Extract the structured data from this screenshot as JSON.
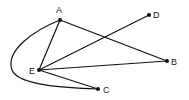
{
  "diagram": {
    "type": "graph",
    "colors": {
      "edge": "#111111",
      "node": "#111111",
      "label": "#222222",
      "background": "#ffffff"
    },
    "nodes": [
      {
        "id": "A",
        "label": "A",
        "x": 60,
        "y": 20,
        "label_x": 56,
        "label_y": 13
      },
      {
        "id": "B",
        "label": "B",
        "x": 167,
        "y": 61,
        "label_x": 171,
        "label_y": 65
      },
      {
        "id": "C",
        "label": "C",
        "x": 98,
        "y": 89,
        "label_x": 103,
        "label_y": 93
      },
      {
        "id": "D",
        "label": "D",
        "x": 149,
        "y": 15,
        "label_x": 153,
        "label_y": 18
      },
      {
        "id": "E",
        "label": "E",
        "x": 39,
        "y": 70,
        "label_x": 29,
        "label_y": 74
      }
    ],
    "edges": [
      {
        "from": "A",
        "to": "E",
        "shape": "straight"
      },
      {
        "from": "A",
        "to": "B",
        "shape": "straight"
      },
      {
        "from": "E",
        "to": "D",
        "shape": "straight"
      },
      {
        "from": "E",
        "to": "B",
        "shape": "straight"
      },
      {
        "from": "E",
        "to": "C",
        "shape": "straight"
      },
      {
        "from": "A",
        "to": "C",
        "shape": "curved",
        "path": "M60,20 C35,30 5,50 12,70 C18,86 70,88 98,89"
      }
    ]
  }
}
